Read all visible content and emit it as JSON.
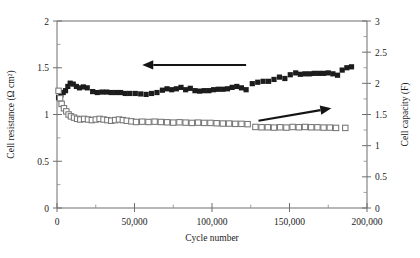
{
  "chart_data": {
    "type": "scatter",
    "title": "",
    "xlabel": "Cycle number",
    "ylabel": "Cell resistance (Ω cm²)",
    "y2label": "Cell capacity (F)",
    "xlim": [
      0,
      200000
    ],
    "ylim": [
      0,
      2
    ],
    "y2lim": [
      0,
      3
    ],
    "grid": false,
    "legend": null,
    "xticks": [
      0,
      50000,
      100000,
      150000,
      200000
    ],
    "xticklabels": [
      "0",
      "50,000",
      "100,000",
      "150,000",
      "200,000"
    ],
    "yticks": [
      0,
      0.5,
      1,
      1.5,
      2
    ],
    "yticklabels": [
      "0",
      "0.5",
      "1",
      "1.5",
      "2"
    ],
    "y2ticks": [
      0,
      0.5,
      1,
      1.5,
      2,
      2.5,
      3
    ],
    "y2ticklabels": [
      "0",
      "0.5",
      "1",
      "1.5",
      "2",
      "2.5",
      "3"
    ],
    "y_minor_step": 0.25,
    "y2_minor_step": 0.25,
    "x_minor_step": 25000,
    "annotations": [
      {
        "name": "arrow-to-left-axis",
        "text": "",
        "x1": 122000,
        "y1": 1.53,
        "x2": 55000,
        "y2": 1.53,
        "axis": "left"
      },
      {
        "name": "arrow-to-right-axis",
        "text": "",
        "x1": 130000,
        "y1": 1.4,
        "x2": 177000,
        "y2": 1.6,
        "axis": "right"
      }
    ],
    "series": [
      {
        "name": "Cell resistance",
        "marker": "filled-square",
        "color": "#1c1c1c",
        "axis": "left",
        "points": [
          [
            1000,
            1.18
          ],
          [
            2500,
            1.21
          ],
          [
            4000,
            1.235
          ],
          [
            5500,
            1.255
          ],
          [
            7000,
            1.3
          ],
          [
            8500,
            1.335
          ],
          [
            10500,
            1.325
          ],
          [
            12500,
            1.3
          ],
          [
            14500,
            1.285
          ],
          [
            17000,
            1.295
          ],
          [
            19500,
            1.285
          ],
          [
            23000,
            1.245
          ],
          [
            26000,
            1.235
          ],
          [
            29000,
            1.24
          ],
          [
            32000,
            1.24
          ],
          [
            35000,
            1.235
          ],
          [
            38000,
            1.235
          ],
          [
            41000,
            1.235
          ],
          [
            44000,
            1.225
          ],
          [
            47000,
            1.225
          ],
          [
            50500,
            1.225
          ],
          [
            54000,
            1.22
          ],
          [
            57500,
            1.215
          ],
          [
            61000,
            1.225
          ],
          [
            64500,
            1.235
          ],
          [
            68000,
            1.26
          ],
          [
            71000,
            1.275
          ],
          [
            74000,
            1.265
          ],
          [
            77000,
            1.275
          ],
          [
            80000,
            1.29
          ],
          [
            83000,
            1.265
          ],
          [
            86000,
            1.28
          ],
          [
            89000,
            1.255
          ],
          [
            92000,
            1.25
          ],
          [
            95000,
            1.255
          ],
          [
            98000,
            1.255
          ],
          [
            101000,
            1.265
          ],
          [
            104000,
            1.27
          ],
          [
            107000,
            1.27
          ],
          [
            110000,
            1.275
          ],
          [
            113000,
            1.29
          ],
          [
            116000,
            1.3
          ],
          [
            119000,
            1.285
          ],
          [
            122000,
            1.265
          ],
          [
            126000,
            1.33
          ],
          [
            129500,
            1.345
          ],
          [
            133000,
            1.355
          ],
          [
            136500,
            1.355
          ],
          [
            140000,
            1.375
          ],
          [
            143500,
            1.4
          ],
          [
            147000,
            1.385
          ],
          [
            150500,
            1.425
          ],
          [
            154000,
            1.445
          ],
          [
            157000,
            1.43
          ],
          [
            160000,
            1.435
          ],
          [
            163000,
            1.435
          ],
          [
            166000,
            1.44
          ],
          [
            169000,
            1.44
          ],
          [
            172000,
            1.44
          ],
          [
            175000,
            1.445
          ],
          [
            178000,
            1.435
          ],
          [
            181000,
            1.42
          ],
          [
            184000,
            1.475
          ],
          [
            187000,
            1.5
          ],
          [
            190000,
            1.51
          ]
        ]
      },
      {
        "name": "Cell capacity",
        "marker": "open-square",
        "color": "#767676",
        "axis": "right",
        "points": [
          [
            1000,
            1.88
          ],
          [
            2000,
            1.76
          ],
          [
            3000,
            1.67
          ],
          [
            4500,
            1.6
          ],
          [
            6000,
            1.55
          ],
          [
            7500,
            1.5
          ],
          [
            9000,
            1.47
          ],
          [
            11000,
            1.45
          ],
          [
            13000,
            1.43
          ],
          [
            15000,
            1.42
          ],
          [
            17500,
            1.43
          ],
          [
            20000,
            1.42
          ],
          [
            22500,
            1.41
          ],
          [
            25000,
            1.42
          ],
          [
            27500,
            1.43
          ],
          [
            30000,
            1.42
          ],
          [
            32500,
            1.41
          ],
          [
            35000,
            1.4
          ],
          [
            37500,
            1.41
          ],
          [
            40000,
            1.42
          ],
          [
            42500,
            1.41
          ],
          [
            45000,
            1.4
          ],
          [
            48000,
            1.39
          ],
          [
            51000,
            1.38
          ],
          [
            55000,
            1.385
          ],
          [
            59000,
            1.38
          ],
          [
            63000,
            1.385
          ],
          [
            67000,
            1.38
          ],
          [
            71000,
            1.375
          ],
          [
            75000,
            1.37
          ],
          [
            79000,
            1.375
          ],
          [
            83000,
            1.37
          ],
          [
            87000,
            1.365
          ],
          [
            91000,
            1.37
          ],
          [
            95000,
            1.365
          ],
          [
            99000,
            1.365
          ],
          [
            103000,
            1.36
          ],
          [
            107000,
            1.355
          ],
          [
            111000,
            1.355
          ],
          [
            115000,
            1.35
          ],
          [
            119000,
            1.35
          ],
          [
            123000,
            1.345
          ],
          [
            128000,
            1.3
          ],
          [
            132000,
            1.295
          ],
          [
            136000,
            1.295
          ],
          [
            140000,
            1.29
          ],
          [
            144000,
            1.295
          ],
          [
            148000,
            1.29
          ],
          [
            152000,
            1.3
          ],
          [
            156000,
            1.295
          ],
          [
            160000,
            1.3
          ],
          [
            164000,
            1.295
          ],
          [
            168000,
            1.295
          ],
          [
            172000,
            1.29
          ],
          [
            176000,
            1.29
          ],
          [
            180000,
            1.285
          ],
          [
            186000,
            1.285
          ]
        ]
      }
    ]
  }
}
